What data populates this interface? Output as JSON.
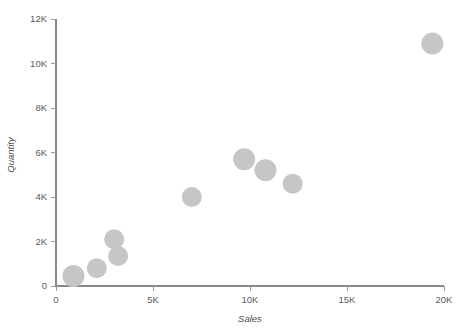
{
  "chart_data": {
    "type": "scatter",
    "title": "",
    "subtitle": "",
    "xlabel": "Sales",
    "ylabel": "Quantity",
    "xlim": [
      0,
      20000
    ],
    "ylim": [
      0,
      12000
    ],
    "grid": false,
    "legend": null,
    "legend_position": "none",
    "marker_color": "#c6c6c6",
    "marker_shape": "circle",
    "x_ticks": [
      0,
      5000,
      10000,
      15000,
      20000
    ],
    "x_tick_labels": [
      "0",
      "5K",
      "10K",
      "15K",
      "20K"
    ],
    "y_ticks": [
      0,
      2000,
      4000,
      6000,
      8000,
      10000,
      12000
    ],
    "y_tick_labels": [
      "0",
      "2K",
      "4K",
      "6K",
      "8K",
      "10K",
      "12K"
    ],
    "points": [
      {
        "x": 900,
        "y": 450,
        "r": 11
      },
      {
        "x": 2100,
        "y": 800,
        "r": 10
      },
      {
        "x": 3000,
        "y": 2100,
        "r": 10
      },
      {
        "x": 3200,
        "y": 1350,
        "r": 10
      },
      {
        "x": 7000,
        "y": 4000,
        "r": 10
      },
      {
        "x": 9700,
        "y": 5700,
        "r": 11
      },
      {
        "x": 10800,
        "y": 5200,
        "r": 11
      },
      {
        "x": 12200,
        "y": 4600,
        "r": 10
      },
      {
        "x": 19400,
        "y": 10900,
        "r": 11
      }
    ]
  },
  "axes": {
    "x_title": "Sales",
    "y_title": "Quantity"
  },
  "colors": {
    "marker": "#c6c6c6",
    "axis": "#888888",
    "tick_text": "#5a5a5a",
    "axis_title": "#4a4a4a",
    "background": "#ffffff"
  }
}
